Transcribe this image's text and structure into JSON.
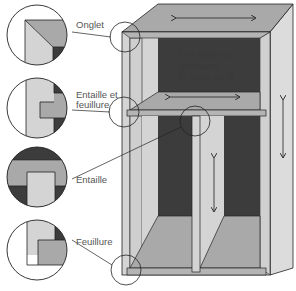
{
  "diagram": {
    "callouts": [
      {
        "id": "onglet",
        "label": "Onglet"
      },
      {
        "id": "entaille-feuillure",
        "label_line1": "Entaille et",
        "label_line2": "feuillure"
      },
      {
        "id": "entaille",
        "label": "Entaille"
      },
      {
        "id": "feuillure",
        "label": "Feuillure"
      }
    ],
    "note": {
      "line1": "Les flèches",
      "line2": "indiquent",
      "line3": "le sens du fil"
    },
    "arrows": [
      {
        "id": "top-panel-arrow",
        "direction": "horizontal-double"
      },
      {
        "id": "shelf-arrow",
        "direction": "horizontal-double"
      },
      {
        "id": "side-panel-arrow",
        "direction": "vertical-double"
      },
      {
        "id": "divider-arrow",
        "direction": "vertical-double"
      }
    ],
    "colors": {
      "light": "#d4d4d4",
      "mid": "#a9a9a9",
      "dark": "#3c3c3c",
      "line": "#222222",
      "white": "#ffffff"
    }
  }
}
